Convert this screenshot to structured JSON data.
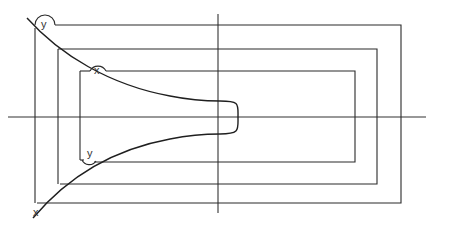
{
  "diagram": {
    "type": "geometric construction",
    "labels": {
      "top_outer_angle": "y",
      "top_inner_angle": "x",
      "bottom_inner_angle": "y",
      "bottom_outer_point": "x"
    },
    "axes": {
      "horizontal": {
        "x1": 8,
        "x2": 426,
        "y": 117
      },
      "vertical": {
        "x": 218,
        "y1": 14,
        "y2": 213
      }
    },
    "colors": {
      "stroke": "#2a2a2a",
      "background": "#ffffff"
    }
  }
}
